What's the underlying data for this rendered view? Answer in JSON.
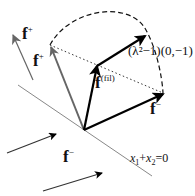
{
  "diagram": {
    "colors": {
      "black": "#000000",
      "gray": "#666666",
      "line": "#888888"
    },
    "labels": {
      "f_plus_outer": {
        "base": "f",
        "sup": "+"
      },
      "f_plus_inner": {
        "base": "f",
        "sup": "+"
      },
      "f_fil": {
        "base": "f",
        "sup": "(fil)"
      },
      "f_minus_right": {
        "base": "f",
        "sup": "−"
      },
      "f_minus_bottom": {
        "base": "f",
        "sup": "−"
      },
      "lambda_vector": "(λ²−1)(0,−1)",
      "line_eq_x1": "x",
      "line_eq_sub1": "1",
      "line_eq_plus": "+",
      "line_eq_x2": "x",
      "line_eq_sub2": "2",
      "line_eq_rest": "=0"
    }
  }
}
